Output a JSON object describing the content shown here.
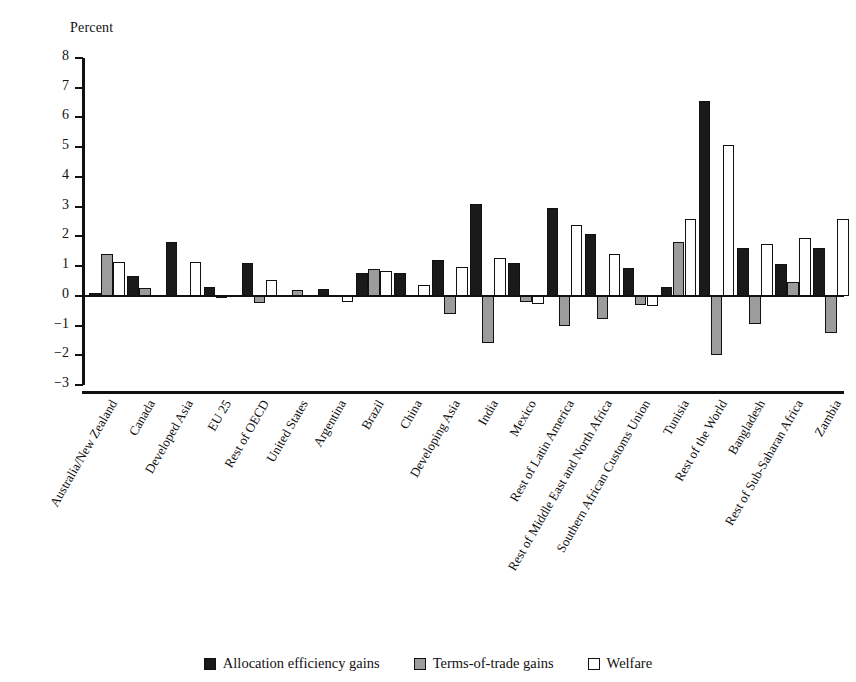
{
  "chart_data": {
    "type": "bar",
    "title": "",
    "xlabel": "",
    "ylabel": "Percent",
    "ylim": [
      -3,
      8
    ],
    "ytick_step": 1,
    "ytick_labels": [
      "8",
      "7",
      "6",
      "5",
      "4",
      "3",
      "2",
      "1",
      "0",
      "−1",
      "−2",
      "−3"
    ],
    "grid": false,
    "legend_position": "bottom-center",
    "categories": [
      "Australia/New Zealand",
      "Canada",
      "Developed Asia",
      "EU 25",
      "Rest of OECD",
      "United States",
      "Argentina",
      "Brazil",
      "China",
      "Developing Asia",
      "India",
      "Mexico",
      "Rest of Latin America",
      "Rest of Middle East and North Africa",
      "Southern African Customs Union",
      "Tunisia",
      "Rest of the World",
      "Bangladesh",
      "Rest of Sub-Saharan Africa",
      "Zambia"
    ],
    "series": [
      {
        "name": "Allocation efficiency gains",
        "color": "#1a1a1a",
        "values": [
          0.1,
          0.65,
          1.82,
          0.28,
          1.12,
          0.0,
          0.22,
          0.78,
          0.78,
          1.2,
          3.08,
          1.1,
          2.95,
          2.08,
          0.95,
          0.3,
          6.55,
          1.62,
          1.08,
          1.6
        ]
      },
      {
        "name": "Terms-of-trade gains",
        "color": "#9c9c9c",
        "values": [
          1.4,
          0.25,
          0.0,
          -0.08,
          -0.25,
          0.18,
          0.0,
          0.9,
          0.0,
          -0.6,
          -1.6,
          -0.22,
          -1.02,
          -0.78,
          -0.32,
          1.82,
          -2.0,
          -0.95,
          0.45,
          -1.25
        ]
      },
      {
        "name": "Welfare",
        "color": "#ffffff",
        "values": [
          1.15,
          0.0,
          1.13,
          0.0,
          0.53,
          0.0,
          -0.2,
          0.82,
          0.35,
          0.98,
          1.27,
          -0.27,
          2.38,
          1.42,
          -0.35,
          2.6,
          5.08,
          1.73,
          1.95,
          2.57
        ]
      }
    ]
  },
  "legend": {
    "items": [
      {
        "label": "Allocation efficiency gains",
        "key": "alloc"
      },
      {
        "label": "Terms-of-trade gains",
        "key": "tot"
      },
      {
        "label": "Welfare",
        "key": "wel"
      }
    ]
  }
}
